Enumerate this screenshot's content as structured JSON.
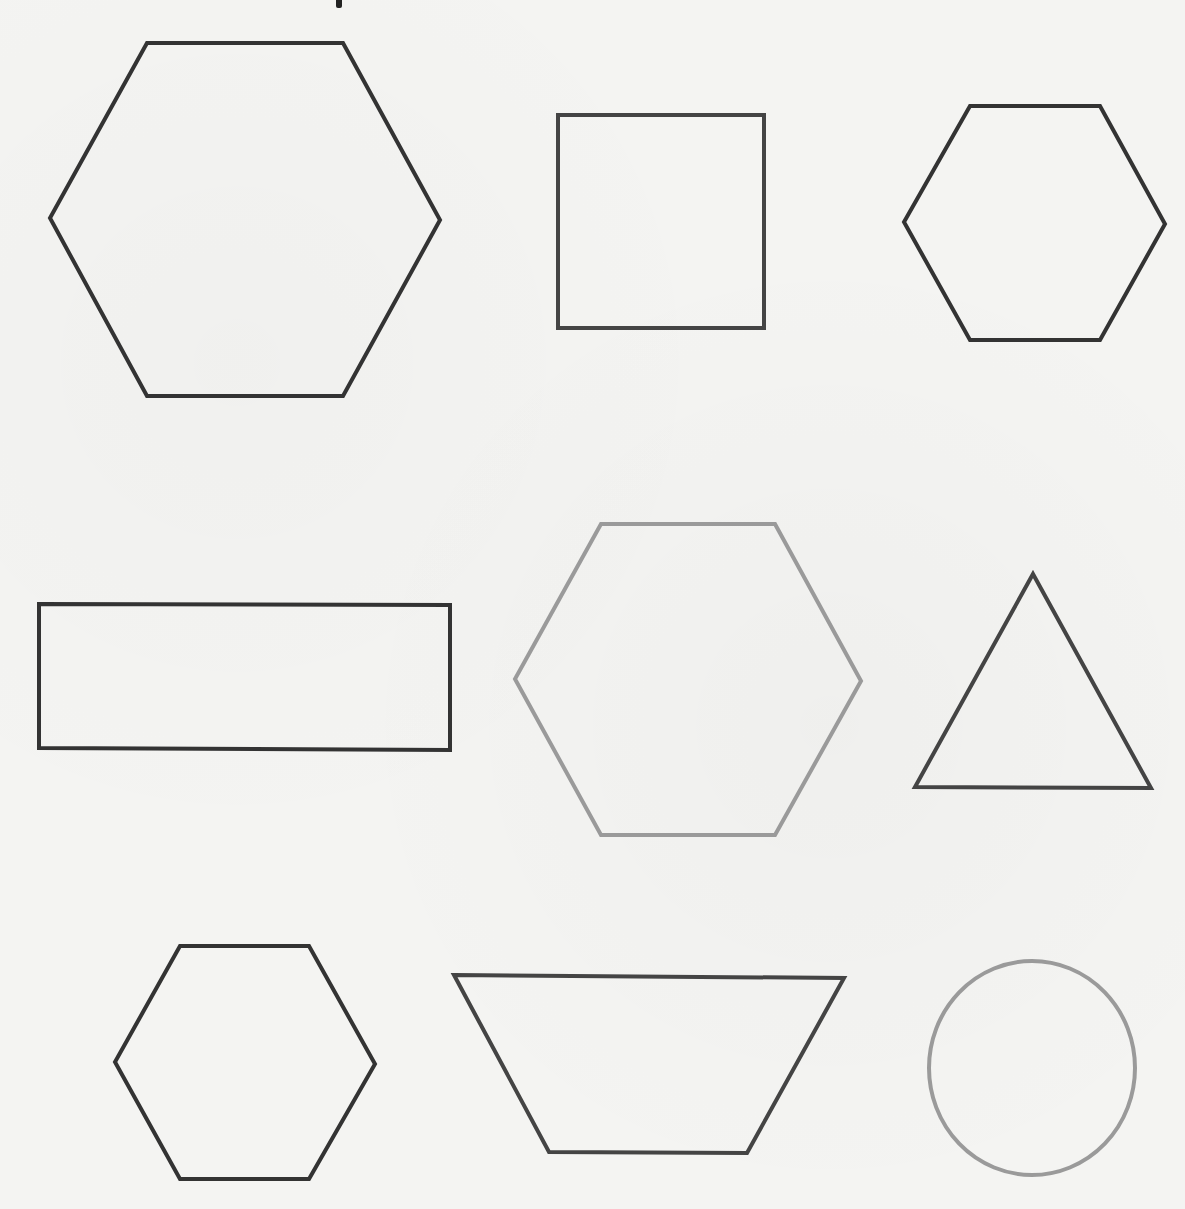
{
  "title_fragment": "p",
  "canvas": {
    "width": 1185,
    "height": 1209,
    "background": "#f4f4f2"
  },
  "colors": {
    "dark": "#333333",
    "medium": "#444444",
    "light": "#9a9a9a"
  },
  "shapes": [
    {
      "id": "large-hexagon",
      "type": "hexagon",
      "row": 1,
      "col": 1,
      "stroke": "#333333",
      "stroke_width": 4,
      "points": "147,43 343,43 440,220 343,396 147,396 50,218"
    },
    {
      "id": "square",
      "type": "square",
      "row": 1,
      "col": 2,
      "stroke": "#444444",
      "stroke_width": 4,
      "points": "558,115 764,115 764,328 558,328"
    },
    {
      "id": "small-hexagon-top-right",
      "type": "hexagon",
      "row": 1,
      "col": 3,
      "stroke": "#333333",
      "stroke_width": 4,
      "points": "970,106 1100,106 1165,224 1100,340 970,340 904,222"
    },
    {
      "id": "rectangle",
      "type": "rectangle",
      "row": 2,
      "col": 1,
      "stroke": "#333333",
      "stroke_width": 4,
      "points": "39,604 450,605 450,750 39,748"
    },
    {
      "id": "gray-hexagon-center",
      "type": "hexagon",
      "row": 2,
      "col": 2,
      "stroke": "#9a9a9a",
      "stroke_width": 4,
      "points": "601,524 775,524 861,681 775,835 601,835 515,679"
    },
    {
      "id": "triangle",
      "type": "triangle",
      "row": 2,
      "col": 3,
      "stroke": "#444444",
      "stroke_width": 4,
      "points": "1033,574 1151,788 915,787"
    },
    {
      "id": "small-hexagon-bottom-left",
      "type": "hexagon",
      "row": 3,
      "col": 1,
      "stroke": "#333333",
      "stroke_width": 4,
      "points": "180,946 309,946 375,1064 309,1179 180,1179 115,1062"
    },
    {
      "id": "trapezoid",
      "type": "trapezoid",
      "row": 3,
      "col": 2,
      "stroke": "#444444",
      "stroke_width": 4,
      "points": "454,975 844,978 747,1153 549,1152"
    },
    {
      "id": "gray-circle",
      "type": "circle",
      "row": 3,
      "col": 3,
      "stroke": "#9a9a9a",
      "stroke_width": 4,
      "cx": 1032,
      "cy": 1068,
      "rx": 103,
      "ry": 107
    }
  ]
}
